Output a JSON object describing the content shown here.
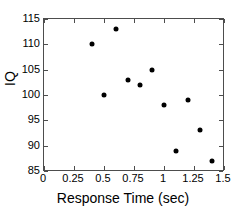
{
  "chart_data": {
    "type": "scatter",
    "title": "",
    "xlabel": "Response Time (sec)",
    "ylabel": "IQ",
    "xlim": [
      0,
      1.5
    ],
    "ylim": [
      85,
      115
    ],
    "grid": false,
    "legend": null,
    "xticks": [
      "0",
      "0.25",
      "0.5",
      "0.75",
      "1",
      "1.25",
      "1.5"
    ],
    "xtick_values": [
      0,
      0.25,
      0.5,
      0.75,
      1,
      1.25,
      1.5
    ],
    "yticks": [
      "85",
      "90",
      "95",
      "100",
      "105",
      "110",
      "115"
    ],
    "ytick_values": [
      85,
      90,
      95,
      100,
      105,
      110,
      115
    ],
    "marker_color": "#000000",
    "marker_shape": "circle",
    "axis_color": "#4d4d4d",
    "background_color": "#ffffff",
    "points": [
      {
        "x": 0.4,
        "y": 110
      },
      {
        "x": 0.5,
        "y": 100
      },
      {
        "x": 0.6,
        "y": 113
      },
      {
        "x": 0.7,
        "y": 103
      },
      {
        "x": 0.8,
        "y": 102
      },
      {
        "x": 0.9,
        "y": 105
      },
      {
        "x": 1.0,
        "y": 98
      },
      {
        "x": 1.1,
        "y": 89
      },
      {
        "x": 1.2,
        "y": 99
      },
      {
        "x": 1.3,
        "y": 93
      },
      {
        "x": 1.4,
        "y": 87
      }
    ],
    "x": [
      0.4,
      0.5,
      0.6,
      0.7,
      0.8,
      0.9,
      1.0,
      1.1,
      1.2,
      1.3,
      1.4
    ],
    "values": [
      110,
      100,
      113,
      103,
      102,
      105,
      98,
      89,
      99,
      93,
      87
    ]
  }
}
